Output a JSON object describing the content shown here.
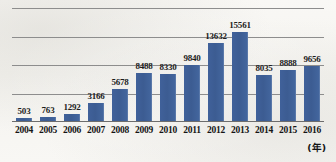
{
  "chart_data": {
    "type": "bar",
    "title": "",
    "xlabel": "(年)",
    "ylabel": "",
    "categories": [
      "2004",
      "2005",
      "2006",
      "2007",
      "2008",
      "2009",
      "2010",
      "2011",
      "2012",
      "2013",
      "2014",
      "2015",
      "2016"
    ],
    "values": [
      503,
      763,
      1292,
      3166,
      5678,
      8488,
      8330,
      9840,
      13632,
      15561,
      8035,
      8888,
      9656
    ],
    "value_labels": [
      "503",
      "763",
      "1292",
      "3166",
      "5678",
      "8488",
      "8330",
      "9840",
      "13632",
      "15561",
      "8035",
      "8888",
      "9656"
    ],
    "ylim": [
      0,
      20000
    ],
    "gridlines": [
      5000,
      10000,
      15000,
      20000
    ],
    "grid": true,
    "legend": "none",
    "series": [
      {
        "name": "",
        "values": [
          503,
          763,
          1292,
          3166,
          5678,
          8488,
          8330,
          9840,
          13632,
          15561,
          8035,
          8888,
          9656
        ]
      }
    ]
  },
  "axis": {
    "unit_label": "(年)"
  },
  "colors": {
    "bar": "#3d5f94",
    "gridline": "#8d8d8d",
    "baseline": "#6d6d6d",
    "text": "#141414",
    "background": "#f7f6f3"
  }
}
